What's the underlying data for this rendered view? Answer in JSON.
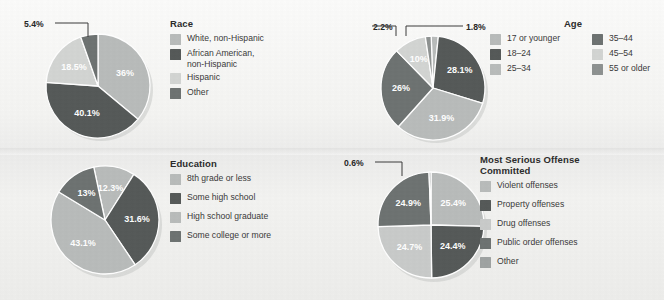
{
  "figure": {
    "background_color": "#f2f2f0",
    "panel_count": 4
  },
  "palette": {
    "g1": "#b9bcbb",
    "g2": "#565a59",
    "g3": "#d3d5d3",
    "g4": "#6e7372",
    "g5": "#8e9291",
    "g6": "#9fa3a2",
    "label_color": "#272727",
    "legend_label_color": "#3a3a3a",
    "pie_divider": "#ffffff"
  },
  "chart_data": [
    {
      "type": "pie",
      "title": "Race",
      "id": "race",
      "legend_position": "right",
      "categories": [
        "White, non-Hispanic",
        "African American,\nnon-Hispanic",
        "Hispanic",
        "Other"
      ],
      "values": [
        36.0,
        40.1,
        18.5,
        5.4
      ],
      "value_labels": [
        "36%",
        "40.1%",
        "18.5%",
        "5.4%"
      ],
      "colors": [
        "#b9bcbb",
        "#565a59",
        "#d3d5d3",
        "#6e7372"
      ],
      "callouts": [
        {
          "label": "5.4%",
          "category": "Other"
        }
      ]
    },
    {
      "type": "pie",
      "title": "Age",
      "id": "age",
      "legend_position": "right",
      "legend_columns": 2,
      "categories": [
        "17 or younger",
        "18–24",
        "25–34",
        "35–44",
        "45–54",
        "55 or older"
      ],
      "values": [
        2.2,
        28.1,
        31.9,
        26.0,
        10.0,
        1.8
      ],
      "value_labels": [
        "2.2%",
        "28.1%",
        "31.9%",
        "26%",
        "10%",
        "1.8%"
      ],
      "colors": [
        "#b9bcbb",
        "#565a59",
        "#b9bcbb",
        "#6e7372",
        "#d3d5d3",
        "#8e9291"
      ],
      "callouts": [
        {
          "label": "2.2%",
          "category": "17 or younger"
        },
        {
          "label": "1.8%",
          "category": "55 or older"
        }
      ]
    },
    {
      "type": "pie",
      "title": "Education",
      "id": "education",
      "legend_position": "right",
      "categories": [
        "8th grade or less",
        "Some high school",
        "High school graduate",
        "Some college or more"
      ],
      "values": [
        12.3,
        31.6,
        43.1,
        13.0
      ],
      "value_labels": [
        "12.3%",
        "31.6%",
        "43.1%",
        "13%"
      ],
      "colors": [
        "#b9bcbb",
        "#565a59",
        "#b9bcbb",
        "#6e7372"
      ],
      "callouts": []
    },
    {
      "type": "pie",
      "title": "Most Serious Offense\nCommitted",
      "id": "offense",
      "legend_position": "right",
      "categories": [
        "Violent offenses",
        "Property offenses",
        "Drug offenses",
        "Public order offenses",
        "Other"
      ],
      "values": [
        25.4,
        24.4,
        24.7,
        24.9,
        0.6
      ],
      "value_labels": [
        "25.4%",
        "24.4%",
        "24.7%",
        "24.9%",
        "0.6%"
      ],
      "colors": [
        "#b9bcbb",
        "#565a59",
        "#c9cbca",
        "#6e7372",
        "#9fa3a2"
      ],
      "callouts": [
        {
          "label": "0.6%",
          "category": "Other"
        }
      ]
    }
  ]
}
